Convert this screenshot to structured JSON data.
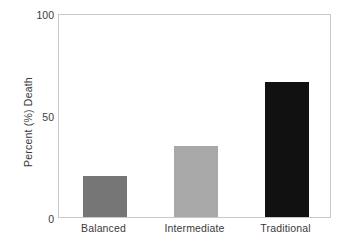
{
  "chart_data": {
    "type": "bar",
    "title": "",
    "subtitle": "",
    "xlabel": "",
    "ylabel": "Percent (%) Death",
    "categories": [
      "Balanced",
      "Intermediate",
      "Traditional"
    ],
    "values": [
      20,
      35,
      66
    ],
    "series": [
      {
        "name": "Percent (%) Death",
        "values": [
          20,
          35,
          66
        ]
      }
    ],
    "bar_colors": [
      "#767676",
      "#a8a8a8",
      "#111111"
    ],
    "ylim": [
      0,
      100
    ],
    "y_ticks": [
      0,
      50,
      100
    ],
    "y_tick_labels": [
      "0",
      "50",
      "100"
    ],
    "grid": false,
    "legend": false,
    "legend_position": "none",
    "frame": true,
    "frame_color": "#c9c9c9",
    "background_color": "#ffffff",
    "annotations": []
  },
  "axes": {
    "y_title": "Percent (%) Death",
    "y_tick_top": "100",
    "y_tick_mid": "50",
    "y_tick_bottom": "0"
  },
  "categories": {
    "first": "Balanced",
    "second": "Intermediate",
    "third": "Traditional"
  }
}
